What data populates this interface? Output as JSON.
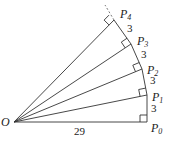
{
  "diagram": {
    "origin": {
      "label": "O",
      "x": 14,
      "y": 122
    },
    "points": [
      {
        "label": "P",
        "sub": "0",
        "x": 147,
        "y": 122,
        "lx": 151,
        "ly": 132
      },
      {
        "label": "P",
        "sub": "1",
        "x": 147,
        "y": 95,
        "lx": 152,
        "ly": 101
      },
      {
        "label": "P",
        "sub": "2",
        "x": 142,
        "y": 69,
        "lx": 147,
        "ly": 74
      },
      {
        "label": "P",
        "sub": "3",
        "x": 131,
        "y": 44,
        "lx": 137,
        "ly": 45
      },
      {
        "label": "P",
        "sub": "4",
        "x": 114,
        "y": 20,
        "lx": 120,
        "ly": 18
      }
    ],
    "segment_labels": [
      {
        "text": "3",
        "x": 151,
        "y": 112
      },
      {
        "text": "3",
        "x": 150,
        "y": 84
      },
      {
        "text": "3",
        "x": 141,
        "y": 58
      },
      {
        "text": "3",
        "x": 127,
        "y": 32
      }
    ],
    "base_label": {
      "text": "29",
      "x": 76,
      "y": 134
    },
    "dashed_extension": {
      "x1": 114,
      "y1": 20,
      "x2": 105,
      "y2": 5
    }
  }
}
